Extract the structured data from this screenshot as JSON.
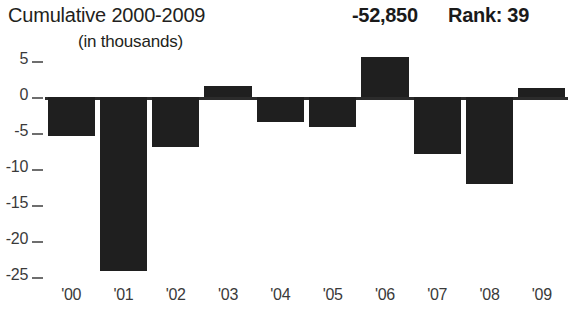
{
  "header": {
    "title": "Cumulative 2000-2009",
    "value": "-52,850",
    "rank": "Rank: 39",
    "subtitle": "(in thousands)"
  },
  "chart_data": {
    "type": "bar",
    "title": "Cumulative 2000-2009",
    "subtitle": "(in thousands)",
    "xlabel": "",
    "ylabel": "",
    "ylim": [
      -26,
      7
    ],
    "grid": false,
    "legend": null,
    "categories": [
      "'00",
      "'01",
      "'02",
      "'03",
      "'04",
      "'05",
      "'06",
      "'07",
      "'08",
      "'09"
    ],
    "values": [
      -5.4,
      -24.2,
      -6.9,
      1.5,
      -3.5,
      -4.2,
      5.5,
      -7.9,
      -12.1,
      1.3
    ],
    "ytick_labels": [
      "5",
      "0",
      "-5",
      "-10",
      "-15",
      "-20",
      "-25"
    ],
    "ytick_values": [
      5,
      0,
      -5,
      -10,
      -15,
      -20,
      -25
    ],
    "bar_color": "#1f1f1f",
    "axis_color": "#2b2b2b",
    "annotations": {
      "cumulative_total": "-52,850",
      "rank": "Rank: 39"
    }
  }
}
